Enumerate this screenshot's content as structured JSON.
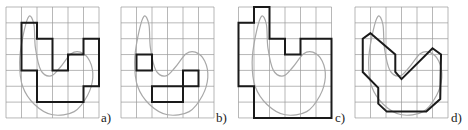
{
  "figure": {
    "grid": {
      "cols": 6,
      "rows": 7,
      "cell_w": 15.5,
      "cell_h": 15.85
    },
    "colors": {
      "grid": "#9a9a9a",
      "curve": "#a8a8a8",
      "outline": "#1a1a1a",
      "background": "#ffffff"
    },
    "curve_points": [
      [
        1.47,
        0.6
      ],
      [
        1.07,
        1.96
      ],
      [
        0.88,
        3.5
      ],
      [
        1.07,
        5.0
      ],
      [
        1.84,
        6.15
      ],
      [
        3.0,
        6.8
      ],
      [
        4.4,
        6.6
      ],
      [
        5.25,
        5.6
      ],
      [
        5.6,
        4.45
      ],
      [
        5.4,
        3.4
      ],
      [
        4.8,
        2.85
      ],
      [
        4.2,
        2.95
      ],
      [
        3.5,
        3.8
      ],
      [
        2.9,
        4.35
      ],
      [
        2.25,
        4.0
      ],
      [
        1.9,
        2.6
      ],
      [
        1.8,
        1.1
      ]
    ],
    "panels": [
      {
        "id": "a",
        "label": "a)",
        "origin": [
          6,
          7
        ],
        "label_pos": [
          101,
          111
        ],
        "description": "outer approximation by grid squares",
        "shapes": [
          [
            [
              1,
              1
            ],
            [
              2,
              1
            ],
            [
              2,
              2
            ],
            [
              3,
              2
            ],
            [
              3,
              4
            ],
            [
              4,
              4
            ],
            [
              4,
              3
            ],
            [
              5,
              3
            ],
            [
              5,
              2
            ],
            [
              6,
              2
            ],
            [
              6,
              5
            ],
            [
              5,
              5
            ],
            [
              5,
              6
            ],
            [
              2,
              6
            ],
            [
              2,
              4
            ],
            [
              1,
              4
            ]
          ]
        ]
      },
      {
        "id": "b",
        "label": "b)",
        "origin": [
          121,
          7
        ],
        "label_pos": [
          216,
          111
        ],
        "description": "squares fully inside the curve",
        "shapes": [
          [
            [
              1,
              3
            ],
            [
              2,
              3
            ],
            [
              2,
              4
            ],
            [
              1,
              4
            ]
          ],
          [
            [
              4,
              4
            ],
            [
              5,
              4
            ],
            [
              5,
              5
            ],
            [
              4,
              5
            ]
          ],
          [
            [
              2,
              5
            ],
            [
              4,
              5
            ],
            [
              4,
              6
            ],
            [
              2,
              6
            ]
          ]
        ]
      },
      {
        "id": "c",
        "label": "c)",
        "origin": [
          238.5,
          7
        ],
        "label_pos": [
          335,
          111
        ],
        "description": "squares touching the curve",
        "shapes": [
          [
            [
              1,
              0
            ],
            [
              2,
              0
            ],
            [
              2,
              2
            ],
            [
              3,
              2
            ],
            [
              3,
              3
            ],
            [
              4,
              3
            ],
            [
              4,
              2
            ],
            [
              6,
              2
            ],
            [
              6,
              7
            ],
            [
              1,
              7
            ],
            [
              1,
              5
            ],
            [
              0,
              5
            ],
            [
              0,
              1
            ],
            [
              1,
              1
            ]
          ]
        ]
      },
      {
        "id": "d",
        "label": "d)",
        "origin": [
          355,
          7
        ],
        "label_pos": [
          451,
          111
        ],
        "description": "polygonal approximation",
        "shapes": [
          [
            [
              1.0,
              1.65
            ],
            [
              0.5,
              2.0
            ],
            [
              0.5,
              4.1
            ],
            [
              1.5,
              5.1
            ],
            [
              1.5,
              6.1
            ],
            [
              2.05,
              6.6
            ],
            [
              4.6,
              6.6
            ],
            [
              5.5,
              5.8
            ],
            [
              5.55,
              3.0
            ],
            [
              5.0,
              2.6
            ],
            [
              3.0,
              4.55
            ],
            [
              2.6,
              4.1
            ],
            [
              2.6,
              3.0
            ]
          ]
        ]
      }
    ]
  }
}
